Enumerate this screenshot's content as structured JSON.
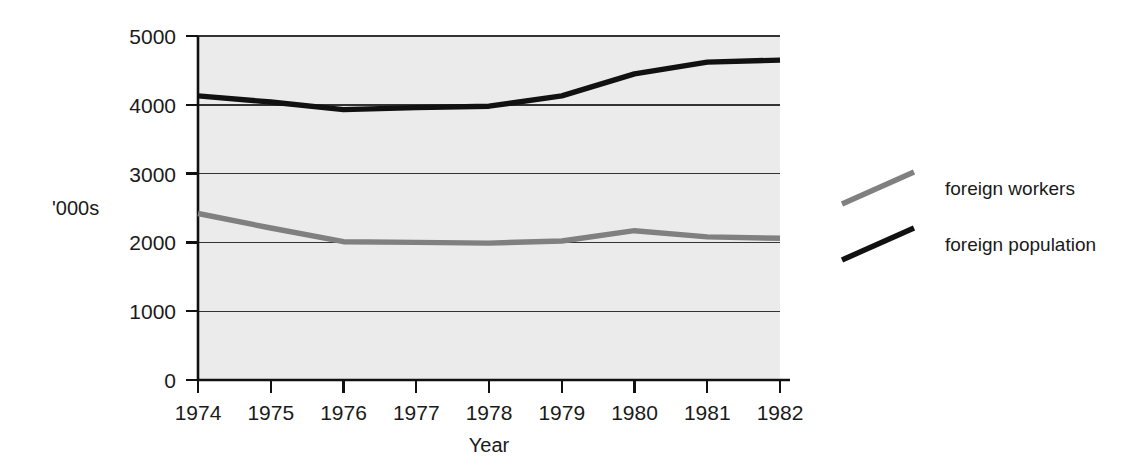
{
  "figure": {
    "y_axis_unit_label": "'000s",
    "x_axis_title": "Year",
    "background_color": "#ffffff",
    "plot_background_color": "#ebebeb"
  },
  "legend": {
    "position": "right",
    "entries": [
      {
        "label": "foreign workers",
        "color": "#808080"
      },
      {
        "label": "foreign population",
        "color": "#111111"
      }
    ]
  },
  "axes": {
    "y_ticks": [
      "0",
      "1000",
      "2000",
      "3000",
      "4000",
      "5000"
    ],
    "x_ticks": [
      "1974",
      "1975",
      "1976",
      "1977",
      "1978",
      "1979",
      "1980",
      "1981",
      "1982"
    ]
  },
  "chart_data": {
    "type": "line",
    "title": "",
    "xlabel": "Year",
    "ylabel": "'000s",
    "categories": [
      "1974",
      "1975",
      "1976",
      "1977",
      "1978",
      "1979",
      "1980",
      "1981",
      "1982"
    ],
    "x": [
      1974,
      1975,
      1976,
      1977,
      1978,
      1979,
      1980,
      1981,
      1982
    ],
    "series": [
      {
        "name": "foreign workers",
        "color": "#808080",
        "values": [
          2420,
          2210,
          2010,
          2000,
          1990,
          2020,
          2170,
          2080,
          2060
        ]
      },
      {
        "name": "foreign population",
        "color": "#111111",
        "values": [
          4130,
          4040,
          3930,
          3960,
          3980,
          4130,
          4450,
          4620,
          4650
        ]
      }
    ],
    "ylim": [
      0,
      5000
    ],
    "ytick_values": [
      0,
      1000,
      2000,
      3000,
      4000,
      5000
    ],
    "xlim": [
      1974,
      1982
    ],
    "grid": "horizontal",
    "legend_position": "right"
  }
}
